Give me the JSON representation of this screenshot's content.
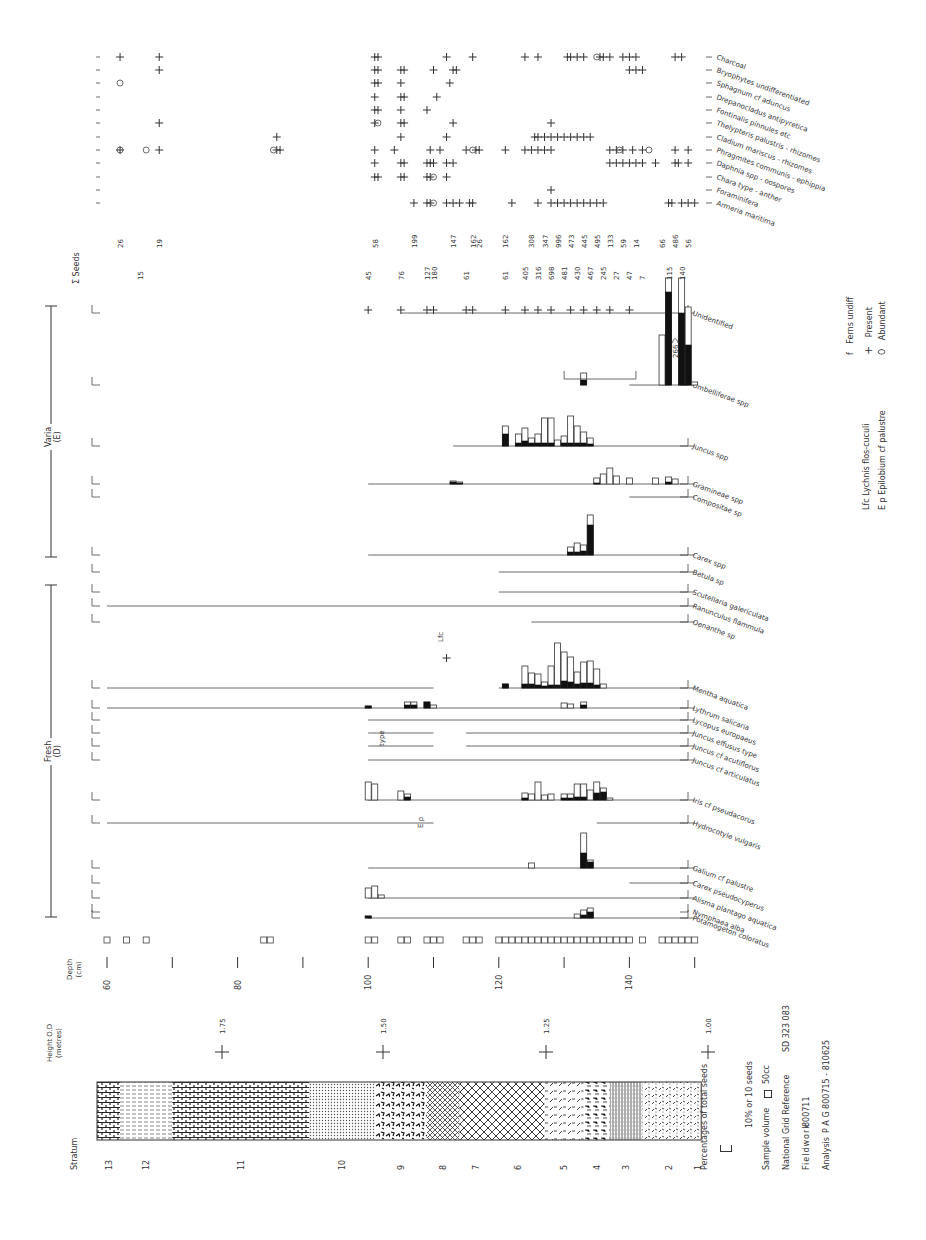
{
  "chart_data": {
    "type": "bar",
    "orientation": "rotated 90° clockwise; depth runs left-to-right",
    "xlabel": "Depth (cm)",
    "ylabel": "Taxa",
    "depth_ticks": [
      60,
      80,
      100,
      120,
      140
    ],
    "depth_range": [
      58,
      150
    ],
    "height_od": {
      "label": "Height O.D (metres)",
      "ticks": [
        "1.75",
        "1.50",
        "1.25",
        "1.00"
      ]
    },
    "stratum": {
      "label": "Stratum",
      "units": [
        "13",
        "12",
        "11",
        "10",
        "9",
        "8",
        "7",
        "6",
        "5",
        "4",
        "3",
        "2",
        "1"
      ]
    },
    "groups": [
      {
        "name": "Fresh",
        "code": "(D)"
      },
      {
        "name": "Varia",
        "code": "(E)"
      }
    ],
    "taxa_fresh": [
      "Potamogeton coloratus",
      "Nymphaea alba",
      "Alisma plantago aquatica",
      "Carex pseudocyperus",
      "Galium cf palustre",
      "Hydrocotyle vulgaris",
      "Iris cf pseudacorus",
      "Juncus cf articulatus",
      "Juncus cf acutiflorus",
      "Juncus effusus type",
      "Lycopus europaeus",
      "Lythrum salicaria",
      "Mentha aquatica",
      "Oenanthe sp",
      "Ranunculus flammula",
      "Scutellaria galericulata"
    ],
    "taxa_varia": [
      "Betula sp",
      "Carex spp",
      "Compositae sp",
      "Gramineae spp",
      "Juncus spp",
      "Umbelliferae spp",
      "Unidentified"
    ],
    "taxa_other": [
      "Armeria maritima",
      "Foraminifera",
      "Chara type - anther",
      "Daphnia spp - oospores",
      "Phragmites communis - ephippia",
      "Cladium mariscus - rhizomes",
      "Thelypteris palustris - rhizomes",
      "Fontinalis pinnules etc",
      "Drepanocladus antipyretica",
      "Sphagnum cf aduncus",
      "Bryophytes undifferentiated",
      "Charcoal"
    ],
    "sum_seeds": {
      "label": "Σ Seeds",
      "row_a": [
        {
          "depth": 62,
          "value": 26
        },
        {
          "depth": 68,
          "value": 19
        },
        {
          "depth": 101,
          "value": 58
        },
        {
          "depth": 107,
          "value": 199
        },
        {
          "depth": 113,
          "value": 147
        },
        {
          "depth": 116,
          "value": 162
        },
        {
          "depth": 117,
          "value": 26
        },
        {
          "depth": 121,
          "value": 162
        },
        {
          "depth": 125,
          "value": 308
        },
        {
          "depth": 127,
          "value": 347
        },
        {
          "depth": 129,
          "value": 996
        },
        {
          "depth": 131,
          "value": 473
        },
        {
          "depth": 133,
          "value": 445
        },
        {
          "depth": 135,
          "value": 495
        },
        {
          "depth": 137,
          "value": 133
        },
        {
          "depth": 139,
          "value": 59
        },
        {
          "depth": 141,
          "value": 14
        },
        {
          "depth": 145,
          "value": 66
        },
        {
          "depth": 147,
          "value": 486
        },
        {
          "depth": 149,
          "value": 56
        }
      ],
      "row_b": [
        {
          "depth": 65,
          "value": 15
        },
        {
          "depth": 100,
          "value": 45
        },
        {
          "depth": 105,
          "value": 76
        },
        {
          "depth": 109,
          "value": 127
        },
        {
          "depth": 110,
          "value": 180
        },
        {
          "depth": 115,
          "value": 61
        },
        {
          "depth": 121,
          "value": 61
        },
        {
          "depth": 124,
          "value": 405
        },
        {
          "depth": 126,
          "value": 316
        },
        {
          "depth": 128,
          "value": 698
        },
        {
          "depth": 130,
          "value": 481
        },
        {
          "depth": 132,
          "value": 430
        },
        {
          "depth": 134,
          "value": 467
        },
        {
          "depth": 136,
          "value": 245
        },
        {
          "depth": 138,
          "value": 27
        },
        {
          "depth": 140,
          "value": 47
        },
        {
          "depth": 142,
          "value": 7
        },
        {
          "depth": 146,
          "value": 115
        },
        {
          "depth": 148,
          "value": 140
        }
      ]
    },
    "annotations": [
      "266",
      "Lfc",
      "type",
      "E p"
    ],
    "scale_bar": "10% or 10 seeds"
  },
  "legend": {
    "percent_label": "Percentages of total seeds",
    "scale_label": "10% or 10 seeds",
    "sample_volume_label": "Sample volume",
    "sample_volume_value": "50cc",
    "grid_ref_label": "National Grid Reference",
    "grid_ref_value": "SD 323 083",
    "fieldwork_label": "Fieldwork",
    "fieldwork_value": "800711",
    "analysis_label": "Analysis",
    "analysis_value": "P A G  800715 - 810625",
    "ferns": "Ferns undiff",
    "ferns_sym": "f",
    "present": "Present",
    "present_sym": "+",
    "abundant": "Abundant",
    "abundant_sym": "O",
    "lfc": "Lfc  Lychnis flos-cuculi",
    "ep": "E p  Epilobium cf palustre"
  },
  "axes": {
    "depth_label": "Depth",
    "depth_unit": "(cm)",
    "height_label": "Height O.D",
    "height_unit": "(metres)",
    "stratum_label": "Stratum",
    "seeds_label": "Σ Seeds",
    "fresh_label": "Fresh",
    "fresh_code": "(D)",
    "varia_label": "Varia",
    "varia_code": "(E)"
  }
}
